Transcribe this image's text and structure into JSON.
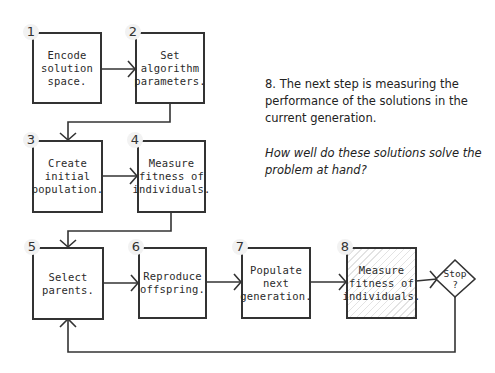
{
  "diagram": {
    "type": "flowchart",
    "steps": [
      {
        "number": "1",
        "label": "Encode\nsolution\nspace."
      },
      {
        "number": "2",
        "label": "Set\nalgorithm\nparameters."
      },
      {
        "number": "3",
        "label": "Create\ninitial\npopulation."
      },
      {
        "number": "4",
        "label": "Measure\nfitness of\nindividuals."
      },
      {
        "number": "5",
        "label": "Select\nparents."
      },
      {
        "number": "6",
        "label": "Reproduce\noffspring."
      },
      {
        "number": "7",
        "label": "Populate\nnext\ngeneration."
      },
      {
        "number": "8",
        "label": "Measure\nfitness of\nindividuals.",
        "highlighted": true
      }
    ],
    "decision": {
      "label": "Stop\n?"
    },
    "colors": {
      "line": "#333333",
      "background": "#ffffff",
      "hatch": "#e3e3e3"
    }
  },
  "note": {
    "text": "8. The next step is measuring the performance of the solutions in the current generation.",
    "question": "How well do these solutions solve the problem at hand?"
  }
}
